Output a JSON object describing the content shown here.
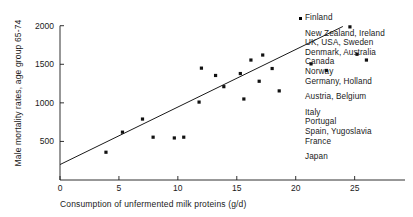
{
  "chart_data": {
    "type": "scatter",
    "title": "",
    "xlabel": "Consumption of unfermented milk proteins (g/d)",
    "ylabel": "Male mortality rates, age group 65-74",
    "xlim": [
      0,
      28
    ],
    "ylim": [
      0,
      2100
    ],
    "xticks": [
      0,
      5,
      10,
      15,
      20,
      25
    ],
    "xtick_labels": [
      "0",
      "5",
      "10",
      "15",
      "20",
      "25"
    ],
    "yticks": [
      500,
      1000,
      1500,
      2000
    ],
    "ytick_labels": [
      "500",
      "1000",
      "1500",
      "2000"
    ],
    "grid": false,
    "legend": "none",
    "points": [
      {
        "x": 3.9,
        "y": 360
      },
      {
        "x": 5.3,
        "y": 620
      },
      {
        "x": 7.0,
        "y": 790
      },
      {
        "x": 7.9,
        "y": 555
      },
      {
        "x": 9.7,
        "y": 545
      },
      {
        "x": 10.5,
        "y": 555
      },
      {
        "x": 11.8,
        "y": 1010
      },
      {
        "x": 13.9,
        "y": 1210
      },
      {
        "x": 15.6,
        "y": 1050
      },
      {
        "x": 16.2,
        "y": 1555
      },
      {
        "x": 17.2,
        "y": 1620
      },
      {
        "x": 18.0,
        "y": 1445
      },
      {
        "x": 18.6,
        "y": 1155
      },
      {
        "x": 16.9,
        "y": 1280
      },
      {
        "x": 15.3,
        "y": 1380
      },
      {
        "x": 13.2,
        "y": 1355
      },
      {
        "x": 12.0,
        "y": 1450
      },
      {
        "x": 21.3,
        "y": 1505
      },
      {
        "x": 22.6,
        "y": 1420
      },
      {
        "x": 25.2,
        "y": 1630
      },
      {
        "x": 26.0,
        "y": 1555
      },
      {
        "x": 24.6,
        "y": 1985
      }
    ],
    "trendline": {
      "label": "regression line",
      "x_start": 0.0,
      "y_start": 200,
      "x_end": 24.0,
      "y_end": 1990
    },
    "annotations": [
      {
        "marker": true,
        "lines": [
          "Finland"
        ]
      },
      {
        "marker": false,
        "lines": [
          "New Zealand, Ireland",
          "UK, USA, Sweden",
          "Denmark, Australia",
          "Canada",
          "Norway"
        ]
      },
      {
        "marker": false,
        "lines": [
          "Germany, Holland"
        ]
      },
      {
        "marker": false,
        "lines": [
          "Austria, Belgium"
        ]
      },
      {
        "marker": false,
        "lines": [
          "Italy",
          "Portugal",
          "Spain, Yugoslavia",
          "France"
        ]
      },
      {
        "marker": false,
        "lines": [
          "Japan"
        ]
      }
    ]
  }
}
